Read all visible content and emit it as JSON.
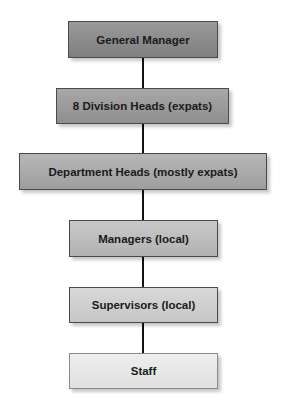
{
  "diagram": {
    "type": "org-chart",
    "levels": [
      {
        "label": "General Manager",
        "fill": "#8a8a8a"
      },
      {
        "label": "8 Division Heads (expats)",
        "fill": "#9a9a9a"
      },
      {
        "label": "Department Heads (mostly expats)",
        "fill": "#a9a9a9"
      },
      {
        "label": "Managers (local)",
        "fill": "#bdbdbd"
      },
      {
        "label": "Supervisors (local)",
        "fill": "#cfcfcf"
      },
      {
        "label": "Staff",
        "fill": "#e6e6e6"
      }
    ]
  }
}
